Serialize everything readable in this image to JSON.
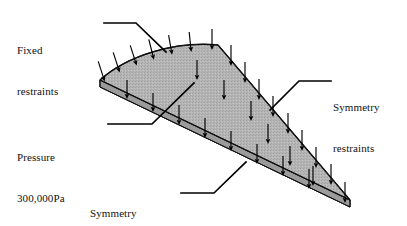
{
  "figure": {
    "background_color": "#ffffff",
    "width": 407,
    "height": 226
  },
  "annotations": [
    {
      "id": "fixed-restraints",
      "line1": "Fixed",
      "line2": "restraints",
      "leader": "horizontal segment then diagonal down-right to the curved top edge of the plate"
    },
    {
      "id": "pressure",
      "line1": "Pressure",
      "line2": "300,000Pa",
      "leader": "horizontal segment then diagonal up-right to the top face of the plate"
    },
    {
      "id": "symmetry-right",
      "line1": "Symmetry",
      "line2": "restraints",
      "leader": "horizontal segment then diagonal down-left to the right straight edge of the plate"
    },
    {
      "id": "symmetry-bottom",
      "line1": "Symmetry",
      "line2": "restraints",
      "leader": "horizontal segment then diagonal up-right to the lower straight edge of the plate"
    }
  ],
  "geometry": {
    "plate_top_face_fill": "#b3b3b3",
    "plate_edge_fill": "#a0a0a0",
    "plate_outline_color": "#1a1a1a",
    "leader_line_color": "#000000",
    "arrow_color": "#000000",
    "vertices": {
      "left": "100,80",
      "apex": "218,45",
      "right": "350,200"
    },
    "plate_thickness_px": 7,
    "top_edge_shape": "convex curve from left vertex up to apex",
    "arrow_count": 30,
    "arrow_direction": "downward, normal to top face"
  }
}
